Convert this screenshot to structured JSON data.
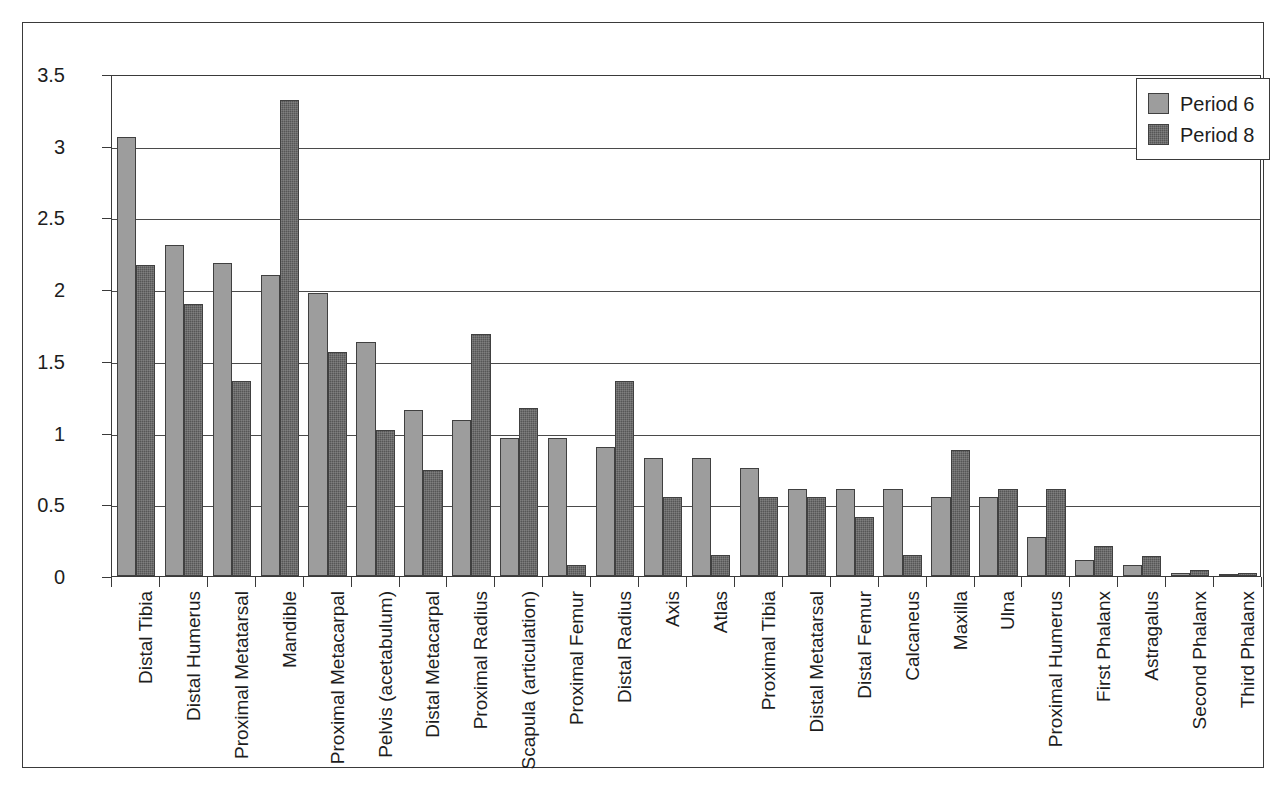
{
  "chart_data": {
    "type": "bar",
    "title": "",
    "subtitle": "",
    "xlabel": "",
    "ylabel": "",
    "ylim": [
      0,
      3.5
    ],
    "yticks": [
      "0",
      "0.5",
      "1",
      "1.5",
      "2",
      "2.5",
      "3",
      "3.5"
    ],
    "ytick_values": [
      0,
      0.5,
      1,
      1.5,
      2,
      2.5,
      3,
      3.5
    ],
    "grid": "horizontal",
    "legend_position": "top-right",
    "categories": [
      "Distal Tibia",
      "Distal Humerus",
      "Proximal Metatarsal",
      "Mandible",
      "Proximal Metacarpal",
      "Pelvis (acetabulum)",
      "Distal Metacarpal",
      "Proximal Radius",
      "Scapula (articulation)",
      "Proximal Femur",
      "Distal Radius",
      "Axis",
      "Atlas",
      "Proximal Tibia",
      "Distal Metatarsal",
      "Distal Femur",
      "Calcaneus",
      "Maxilla",
      "Ulna",
      "Proximal Humerus",
      "First Phalanx",
      "Astragalus",
      "Second Phalanx",
      "Third Phalanx"
    ],
    "series": [
      {
        "name": "Period 6",
        "color": "#9d9d9d",
        "values": [
          3.06,
          2.31,
          2.18,
          2.1,
          1.97,
          1.63,
          1.16,
          1.09,
          0.96,
          0.96,
          0.9,
          0.82,
          0.82,
          0.75,
          0.61,
          0.61,
          0.61,
          0.55,
          0.55,
          0.27,
          0.11,
          0.08,
          0.02,
          0.01
        ]
      },
      {
        "name": "Period 8",
        "color": "#565656",
        "values": [
          2.17,
          1.9,
          1.36,
          3.32,
          1.56,
          1.02,
          0.74,
          1.69,
          1.17,
          0.08,
          1.36,
          0.55,
          0.15,
          0.55,
          0.55,
          0.41,
          0.15,
          0.88,
          0.61,
          0.61,
          0.21,
          0.14,
          0.04,
          0.02
        ]
      }
    ]
  },
  "legend": {
    "items": [
      {
        "label": "Period 6"
      },
      {
        "label": "Period 8"
      }
    ]
  }
}
